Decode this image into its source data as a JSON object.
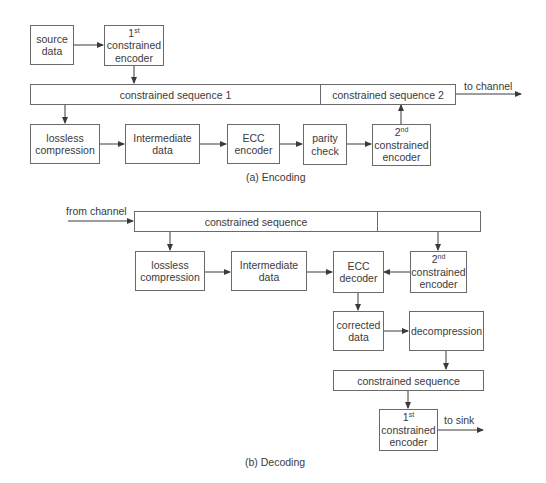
{
  "encoding": {
    "caption": "(a) Encoding",
    "source_data": [
      "source",
      "data"
    ],
    "first_encoder": {
      "ord": "1",
      "sup": "st",
      "lines": [
        "constrained",
        "encoder"
      ]
    },
    "seq1": "constrained sequence 1",
    "seq2": "constrained sequence 2",
    "to_channel": "to channel",
    "lossless": [
      "lossless",
      "compression"
    ],
    "intermediate": [
      "Intermediate",
      "data"
    ],
    "ecc": [
      "ECC",
      "encoder"
    ],
    "parity": [
      "parity",
      "check"
    ],
    "second_encoder": {
      "ord": "2",
      "sup": "nd",
      "lines": [
        "constrained",
        "encoder"
      ]
    }
  },
  "decoding": {
    "caption": "(b) Decoding",
    "from_channel": "from channel",
    "seq": "constrained sequence",
    "seq_right": "",
    "lossless": [
      "lossless",
      "compression"
    ],
    "intermediate": [
      "Intermediate",
      "data"
    ],
    "ecc": [
      "ECC",
      "decoder"
    ],
    "second_encoder": {
      "ord": "2",
      "sup": "nd",
      "lines": [
        "constrained",
        "encoder"
      ]
    },
    "corrected": [
      "corrected",
      "data"
    ],
    "decompression": "decompression",
    "seq_out": "constrained sequence",
    "first_encoder": {
      "ord": "1",
      "sup": "st",
      "lines": [
        "constrained",
        "encoder"
      ]
    },
    "to_sink": "to sink"
  },
  "colors": {
    "line": "#6a6a6a",
    "text": "#3a3a3a"
  }
}
